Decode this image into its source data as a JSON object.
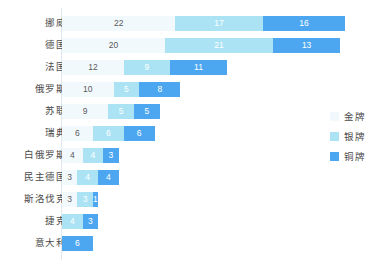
{
  "chart_data": {
    "type": "bar",
    "subtype": "stacked-horizontal",
    "title": "",
    "xlabel": "",
    "ylabel": "",
    "grid": false,
    "legend_position": "right",
    "categories": [
      "挪威",
      "德国",
      "法国",
      "俄罗斯",
      "苏联",
      "瑞典",
      "白俄罗斯",
      "民主德国",
      "斯洛伐克",
      "捷克",
      "意大利"
    ],
    "series": [
      {
        "name": "金牌",
        "color": "#f2f9fd",
        "values": [
          22,
          20,
          12,
          10,
          9,
          6,
          4,
          3,
          3,
          0,
          0
        ]
      },
      {
        "name": "银牌",
        "color": "#ace3f4",
        "values": [
          17,
          21,
          9,
          5,
          5,
          6,
          4,
          4,
          3,
          4,
          0
        ]
      },
      {
        "name": "铜牌",
        "color": "#4da7f0",
        "values": [
          16,
          13,
          11,
          8,
          5,
          6,
          3,
          4,
          1,
          3,
          6
        ]
      }
    ]
  },
  "rows": [
    {
      "label": "挪威",
      "gold": 22,
      "silver": 17,
      "bronze": 16
    },
    {
      "label": "德国",
      "gold": 20,
      "silver": 21,
      "bronze": 13
    },
    {
      "label": "法国",
      "gold": 12,
      "silver": 9,
      "bronze": 11
    },
    {
      "label": "俄罗斯",
      "gold": 10,
      "silver": 5,
      "bronze": 8
    },
    {
      "label": "苏联",
      "gold": 9,
      "silver": 5,
      "bronze": 5
    },
    {
      "label": "瑞典",
      "gold": 6,
      "silver": 6,
      "bronze": 6
    },
    {
      "label": "白俄罗斯",
      "gold": 4,
      "silver": 4,
      "bronze": 3
    },
    {
      "label": "民主德国",
      "gold": 3,
      "silver": 4,
      "bronze": 4
    },
    {
      "label": "斯洛伐克",
      "gold": 3,
      "silver": 3,
      "bronze": 1
    },
    {
      "label": "捷克",
      "gold": 0,
      "silver": 4,
      "bronze": 3
    },
    {
      "label": "意大利",
      "gold": 0,
      "silver": 0,
      "bronze": 6
    }
  ],
  "legend": {
    "items": [
      {
        "key": "gold",
        "label": "金牌"
      },
      {
        "key": "silver",
        "label": "银牌"
      },
      {
        "key": "bronze",
        "label": "铜牌"
      }
    ]
  },
  "layout": {
    "bar_origin_x": 62,
    "unit_px": 5.15,
    "row_height": 22,
    "first_row_top": 12
  }
}
